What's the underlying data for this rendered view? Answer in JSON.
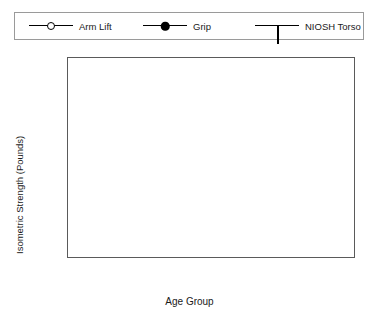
{
  "legend": {
    "entries": [
      {
        "label": "Arm Lift",
        "marker": "open-circle-marker"
      },
      {
        "label": "Grip",
        "marker": "filled-circle-marker"
      },
      {
        "label": "NIOSH Torso",
        "marker": "square-marker"
      }
    ]
  },
  "chart_data": {
    "type": "line",
    "title": "",
    "xlabel": "Age Group",
    "ylabel": "Isometric Strength (Pounds)",
    "categories": [
      "< 20",
      "20–29",
      "30–39",
      "40–49",
      "50–59",
      "60–70"
    ],
    "ylim": [
      50,
      300
    ],
    "yticks": [
      50,
      100,
      150,
      200,
      250,
      300
    ],
    "grid": true,
    "legend_position": "top",
    "series": [
      {
        "name": "Arm Lift",
        "marker": "open-circle",
        "values": [
          89,
          91,
          95,
          92,
          90,
          88
        ]
      },
      {
        "name": "Grip",
        "marker": "filled-circle",
        "values": [
          116,
          119,
          120,
          115,
          109,
          105
        ]
      },
      {
        "name": "NIOSH Torso",
        "marker": "square",
        "values": [
          240,
          246,
          246,
          242,
          239,
          234
        ]
      }
    ]
  },
  "colors": {
    "line": "#000000",
    "grid": "#a8a8a8",
    "frame": "#5a5a5a",
    "text": "#1a1a1a",
    "background": "#ffffff"
  }
}
